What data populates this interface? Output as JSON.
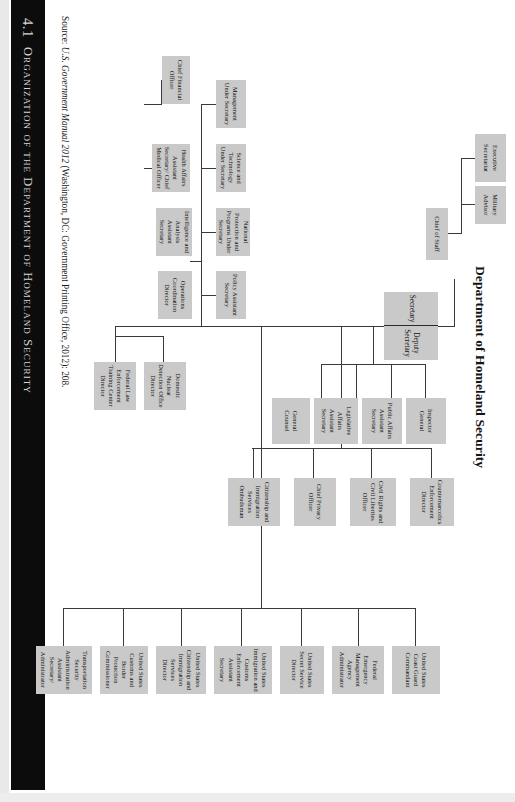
{
  "header": {
    "number": "4.1",
    "text": "Organization of the Department of Homeland Security"
  },
  "chart_title": "Department of Homeland Security",
  "source": {
    "prefix": "Source: ",
    "italic_title": "U.S. Government Manual 2012",
    "suffix": " (Washington, DC: Government Printing Office, 2012): 208."
  },
  "nodes": {
    "root": {
      "left": "Secretary",
      "right": "Deputy Secretary"
    },
    "chief_of_staff": "Chief of Staff",
    "executive_secretariat": "Executive Secretariat",
    "military_advisor": "Military Advisor",
    "inspector_general": "Inspector General",
    "public_affairs": "Public Affairs Assistant Secretary",
    "legislative_affairs": "Legislative Affairs Assistant Secretary",
    "general_counsel": "General Counsel",
    "counternarcotics": "Counternarcotics Enforcement Director",
    "civil_rights": "Civil Rights and Civil Liberties Officer",
    "chief_privacy": "Chief Privacy Officer",
    "cis_ombudsman": "Citizenship and Immigration Services Ombudsman",
    "management": "Management Under Secretary",
    "science_technology": "Science and Technology Under Secretary",
    "national_protection": "National Protection and Programs Under Secretary",
    "policy": "Policy Assistant Secretary",
    "chief_financial_officer": "Chief Financial Officer",
    "health_affairs": "Health Affairs Assistant Secretary/ Chief Medical Officer",
    "intelligence_analysis": "Intelligence and Analysis Assistant Secretary",
    "operations_coordination": "Operations Coordination Director",
    "fletc": "Federal Law Enforcement Training Center Director",
    "dndo": "Domestic Nuclear Detection Office Director",
    "tsa": "Transportation Security Administration Assistant Secretary/ Administrator",
    "cbp": "United States Customs and Border Protection Commissioner",
    "uscis": "United States Citizenship and Immigration Services Director",
    "ice": "United States Immigration and Customs Enforcement Assistant Secretary",
    "secret_service": "United States Secret Service Director",
    "fema": "Federal Emergency Management Agency Administrator",
    "coast_guard": "United States Coast Guard Commandant"
  }
}
